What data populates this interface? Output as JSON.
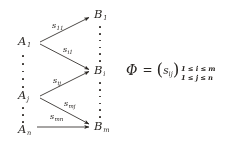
{
  "figure": {
    "background_color": "#ffffff",
    "ink_color": "#2a2724"
  },
  "domain_nodes": [
    {
      "name": "A-1",
      "base": "A",
      "sub": "1",
      "x": 18,
      "y": 43
    },
    {
      "name": "A-j",
      "base": "A",
      "sub": "j",
      "x": 18,
      "y": 97
    },
    {
      "name": "A-n",
      "base": "A",
      "sub": "n",
      "x": 18,
      "y": 131
    }
  ],
  "codomain_nodes": [
    {
      "name": "B-1",
      "base": "B",
      "sub": "1",
      "x": 96,
      "y": 16
    },
    {
      "name": "B-i",
      "base": "B",
      "sub": "i",
      "x": 96,
      "y": 72
    },
    {
      "name": "B-m",
      "base": "B",
      "sub": "m",
      "x": 96,
      "y": 128
    }
  ],
  "arrows": [
    {
      "name": "arrow-a1-b1",
      "from": "A-1",
      "to": "B-1",
      "label_base": "s",
      "label_sub": "11",
      "x1": 40,
      "y1": 42,
      "x2": 91,
      "y2": 17,
      "label_x": 52,
      "label_y": 23
    },
    {
      "name": "arrow-a1-bi",
      "from": "A-1",
      "to": "B-i",
      "label_base": "s",
      "label_sub": "i1",
      "x1": 40,
      "y1": 44,
      "x2": 91,
      "y2": 70,
      "label_x": 63,
      "label_y": 47
    },
    {
      "name": "arrow-aj-bi",
      "from": "A-j",
      "to": "B-i",
      "label_base": "s",
      "label_sub": "ij",
      "x1": 40,
      "y1": 96,
      "x2": 91,
      "y2": 71,
      "label_x": 53,
      "label_y": 78
    },
    {
      "name": "arrow-aj-bm",
      "from": "A-j",
      "to": "B-m",
      "label_base": "s",
      "label_sub": "mj",
      "x1": 40,
      "y1": 98,
      "x2": 91,
      "y2": 124,
      "label_x": 64,
      "label_y": 101
    },
    {
      "name": "arrow-an-bm",
      "from": "A-n",
      "to": "B-m",
      "label_base": "s",
      "label_sub": "mn",
      "x1": 37,
      "y1": 127,
      "x2": 91,
      "y2": 127,
      "label_x": 50,
      "label_y": 114
    }
  ],
  "ellipses": [
    {
      "name": "dots-a-upper",
      "x": 22,
      "y": 55,
      "height": 33,
      "count": 5
    },
    {
      "name": "dots-a-lower",
      "x": 22,
      "y": 107,
      "height": 16,
      "count": 3
    },
    {
      "name": "dots-b-upper",
      "x": 99,
      "y": 26,
      "height": 36,
      "count": 6
    },
    {
      "name": "dots-b-lower",
      "x": 99,
      "y": 82,
      "height": 36,
      "count": 6
    }
  ],
  "formula": {
    "name": "matrix-definition",
    "x": 126,
    "y": 61,
    "phi": "Φ",
    "equals": "=",
    "open_paren": "(",
    "close_paren": ")",
    "matrix_base": "s",
    "matrix_sub": "ij",
    "range_row1": "1 ≤ i ≤ m",
    "range_row2": "1 ≤ j ≤ n"
  }
}
